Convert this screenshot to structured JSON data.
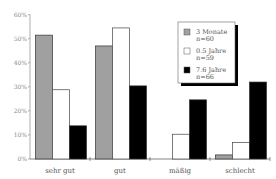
{
  "chart_data": {
    "type": "bar",
    "title": "",
    "xlabel": "",
    "ylabel": "",
    "ylim": [
      0,
      60
    ],
    "yticks": [
      "0%",
      "10%",
      "20%",
      "30%",
      "40%",
      "50%",
      "60%"
    ],
    "categories": [
      "sehr gut",
      "gut",
      "mäßig",
      "schlecht"
    ],
    "series": [
      {
        "name": "3 Monate",
        "sub": "n=60",
        "color": "#a0a0a0",
        "values": [
          51.5,
          47,
          0,
          1.7
        ]
      },
      {
        "name": "0.5 Jahre",
        "sub": "n=59",
        "color": "#ffffff",
        "values": [
          28.8,
          54.5,
          10.3,
          6.8
        ]
      },
      {
        "name": "7.6 Jahre",
        "sub": "n=66",
        "color": "#000000",
        "values": [
          13.8,
          30.4,
          24.6,
          32
        ]
      }
    ],
    "legend_position": "upper-right-inside",
    "grid": false
  }
}
